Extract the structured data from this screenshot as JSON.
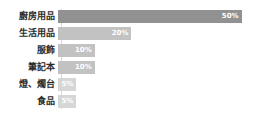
{
  "chart_data": {
    "type": "bar",
    "orientation": "horizontal",
    "title": "",
    "xlabel": "",
    "ylabel": "",
    "xlim": [
      0,
      55
    ],
    "grid": false,
    "legend": false,
    "value_suffix": "%",
    "categories": [
      "廚房用品",
      "生活用品",
      "服飾",
      "筆記本",
      "燈、燭台",
      "食品"
    ],
    "values": [
      50,
      20,
      10,
      10,
      5,
      5
    ],
    "labels": [
      "50%",
      "20%",
      "10%",
      "10%",
      "5%",
      "5%"
    ],
    "colors": [
      "#919191",
      "#c2c2c2",
      "#c2c2c2",
      "#c2c2c2",
      "#d6d6d6",
      "#d6d6d6"
    ],
    "bars": [
      {
        "category": "廚房用品",
        "value": 50,
        "label": "50%",
        "color": "#919191"
      },
      {
        "category": "生活用品",
        "value": 20,
        "label": "20%",
        "color": "#c2c2c2"
      },
      {
        "category": "服飾",
        "value": 10,
        "label": "10%",
        "color": "#c2c2c2"
      },
      {
        "category": "筆記本",
        "value": 10,
        "label": "10%",
        "color": "#c2c2c2"
      },
      {
        "category": "燈、燭台",
        "value": 5,
        "label": "5%",
        "color": "#d6d6d6"
      },
      {
        "category": "食品",
        "value": 5,
        "label": "5%",
        "color": "#d6d6d6"
      }
    ]
  }
}
